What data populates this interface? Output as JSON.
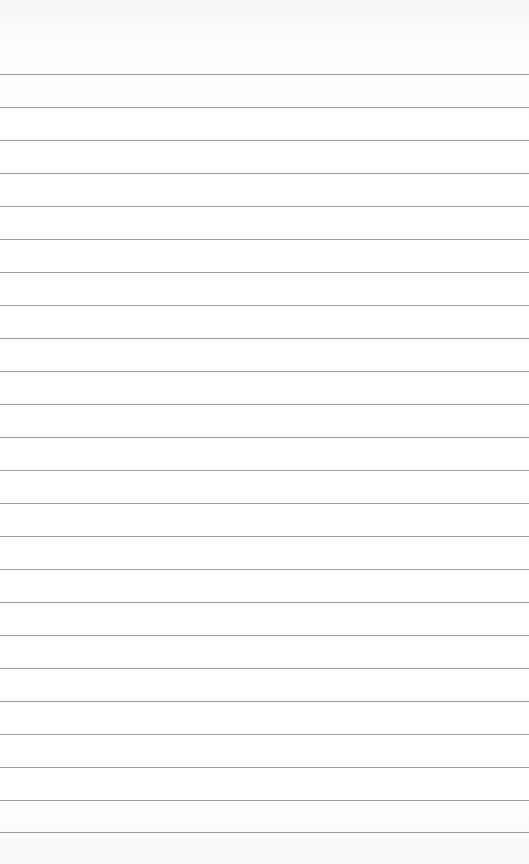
{
  "paper": {
    "type": "ruled-lined-paper",
    "line_color": "#8a8a8a",
    "background_color": "#ffffff",
    "line_count": 24,
    "line_positions": [
      74,
      107,
      140,
      173,
      206,
      239,
      272,
      305,
      338,
      371,
      404,
      437,
      470,
      503,
      536,
      569,
      602,
      635,
      668,
      701,
      734,
      767,
      800,
      832
    ]
  }
}
